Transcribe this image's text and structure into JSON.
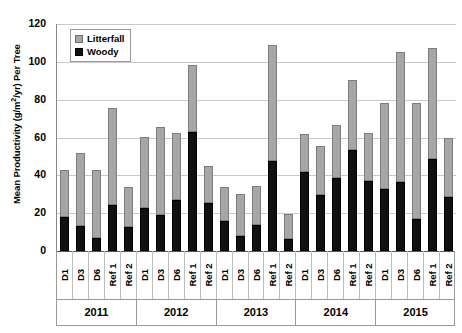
{
  "chart_data": {
    "type": "bar",
    "title": "",
    "xlabel": "",
    "ylabel": "Mean Productivity (g/m2/yr) Per Tree",
    "ylabel_parts": {
      "pre": "Mean Productivity (g/m",
      "sup": "2",
      "post": "/yr) Per Tree"
    },
    "ylim": [
      0,
      120
    ],
    "yticks": [
      0,
      20,
      40,
      60,
      80,
      100,
      120
    ],
    "ytick_labels": [
      "0",
      "20",
      "40",
      "60",
      "80",
      "100",
      "120"
    ],
    "grid": true,
    "stacked": true,
    "legend_position": "top-left",
    "legend": [
      {
        "label": "Litterfall",
        "color": "#a6a6a6"
      },
      {
        "label": "Woody",
        "color": "#111111"
      }
    ],
    "series": [
      {
        "name": "Woody",
        "color": "#111111",
        "values": [
          18,
          13,
          7,
          24.5,
          12.5,
          23,
          19,
          27,
          63,
          25.5,
          16,
          8,
          14,
          47.5,
          6.5,
          42,
          29.5,
          38.5,
          53.5,
          37,
          33,
          36.5,
          17,
          48.5,
          28.5
        ]
      },
      {
        "name": "Litterfall",
        "color": "#a6a6a6",
        "values": [
          25,
          39,
          36,
          51,
          21.5,
          37.5,
          46.5,
          35.5,
          35.5,
          19.5,
          18,
          22,
          20.5,
          61.5,
          13,
          20,
          26,
          28,
          37,
          25.5,
          45.5,
          68.5,
          61,
          59,
          31
        ]
      }
    ],
    "totals": [
      43,
      52,
      43,
      75.5,
      34,
      60.5,
      65.5,
      62.5,
      98.5,
      45,
      34,
      30,
      34.5,
      109,
      19.5,
      62,
      55.5,
      66.5,
      90.5,
      62.5,
      78.5,
      105,
      78,
      107.5,
      59.5
    ],
    "categories": [
      "D1",
      "D3",
      "D6",
      "Ref 1",
      "Ref 2",
      "D1",
      "D3",
      "D6",
      "Ref 1",
      "Ref 2",
      "D1",
      "D3",
      "D6",
      "Ref 1",
      "Ref 2",
      "D1",
      "D3",
      "D6",
      "Ref 1",
      "Ref 2",
      "D1",
      "D3",
      "D6",
      "Ref 1",
      "Ref 2"
    ],
    "groups": [
      {
        "year": "2011",
        "categories": [
          "D1",
          "D3",
          "D6",
          "Ref 1",
          "Ref 2"
        ],
        "woody": [
          18,
          13,
          7,
          24.5,
          12.5
        ],
        "litterfall": [
          25,
          39,
          36,
          51,
          21.5
        ],
        "totals": [
          43,
          52,
          43,
          75.5,
          34
        ]
      },
      {
        "year": "2012",
        "categories": [
          "D1",
          "D3",
          "D6",
          "Ref 1",
          "Ref 2"
        ],
        "woody": [
          23,
          19,
          27,
          63,
          25.5
        ],
        "litterfall": [
          37.5,
          46.5,
          35.5,
          35.5,
          19.5
        ],
        "totals": [
          60.5,
          65.5,
          62.5,
          98.5,
          45
        ]
      },
      {
        "year": "2013",
        "categories": [
          "D1",
          "D3",
          "D6",
          "Ref 1",
          "Ref 2"
        ],
        "woody": [
          16,
          8,
          14,
          47.5,
          6.5
        ],
        "litterfall": [
          18,
          22,
          20.5,
          61.5,
          13
        ],
        "totals": [
          34,
          30,
          34.5,
          109,
          19.5
        ]
      },
      {
        "year": "2014",
        "categories": [
          "D1",
          "D3",
          "D6",
          "Ref 1",
          "Ref 2"
        ],
        "woody": [
          42,
          29.5,
          38.5,
          53.5,
          37
        ],
        "litterfall": [
          20,
          26,
          28,
          37,
          25.5
        ],
        "totals": [
          62,
          55.5,
          66.5,
          90.5,
          62.5
        ]
      },
      {
        "year": "2015",
        "categories": [
          "D1",
          "D3",
          "D6",
          "Ref 1",
          "Ref 2"
        ],
        "woody": [
          33,
          36.5,
          17,
          48.5,
          28.5
        ],
        "litterfall": [
          45.5,
          68.5,
          61,
          59,
          31
        ],
        "totals": [
          78.5,
          105,
          78,
          107.5,
          59.5
        ]
      }
    ],
    "years": [
      "2011",
      "2012",
      "2013",
      "2014",
      "2015"
    ]
  }
}
